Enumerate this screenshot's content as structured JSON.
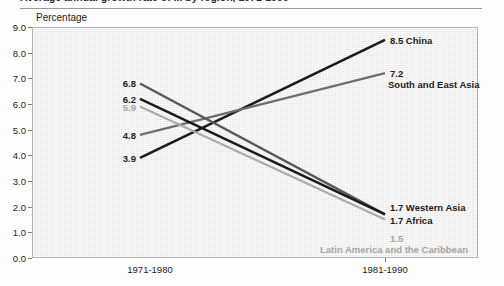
{
  "figure": {
    "title_partial": "Average annual growth rate of ... by region, 1971-1990",
    "y_axis_title": "Percentage"
  },
  "chart_data": {
    "type": "line",
    "title": "",
    "xlabel": "",
    "ylabel": "Percentage",
    "categories": [
      "1971-1980",
      "1981-1990"
    ],
    "ylim": [
      0.0,
      9.0
    ],
    "ytick_labels": [
      "0.0",
      "1.0",
      "2.0",
      "3.0",
      "4.0",
      "5.0",
      "6.0",
      "7.0",
      "8.0",
      "9.0"
    ],
    "yticks": [
      0.0,
      1.0,
      2.0,
      3.0,
      4.0,
      5.0,
      6.0,
      7.0,
      8.0,
      9.0
    ],
    "grid": false,
    "legend_position": "inline-endpoint-labels",
    "series": [
      {
        "name": "China",
        "values": [
          3.9,
          8.5
        ],
        "start_label": "3.9",
        "end_label": "8.5",
        "color": "#1a1a1a",
        "width": 2.6
      },
      {
        "name": "South and East Asia",
        "values": [
          4.8,
          7.2
        ],
        "start_label": "4.8",
        "end_label": "7.2",
        "color": "#6e6e6e",
        "width": 2.3
      },
      {
        "name": "Western Asia",
        "values": [
          6.8,
          1.7
        ],
        "start_label": "6.8",
        "end_label": "1.7",
        "color": "#585858",
        "width": 2.3
      },
      {
        "name": "Africa",
        "values": [
          6.2,
          1.7
        ],
        "start_label": "6.2",
        "end_label": "1.7",
        "color": "#1a1a1a",
        "width": 2.4
      },
      {
        "name": "Latin America and the Caribbean",
        "values": [
          5.9,
          1.5
        ],
        "start_label": "5.9",
        "end_label": "1.5",
        "color": "#ababab",
        "width": 2.2
      }
    ]
  },
  "left_labels": [
    {
      "value": "6.8",
      "color": "#1d1d1d"
    },
    {
      "value": "6.2",
      "color": "#1d1d1d"
    },
    {
      "value": "5.9",
      "color": "#a5a5a5"
    },
    {
      "value": "4.8",
      "color": "#1d1d1d"
    },
    {
      "value": "3.9",
      "color": "#1d1d1d"
    }
  ],
  "right_labels": [
    {
      "value": "8.5",
      "name": "China",
      "color": "#1d1d1d"
    },
    {
      "value": "7.2",
      "name": "South and East Asia",
      "color": "#1d1d1d"
    },
    {
      "value": "1.7",
      "name": "Western Asia",
      "color": "#1d1d1d"
    },
    {
      "value": "1.7",
      "name": "Africa",
      "color": "#1d1d1d"
    },
    {
      "value": "1.5",
      "name": "Latin America and the Caribbean",
      "color": "#a5a5a5"
    }
  ],
  "x_labels": [
    "1971-1980",
    "1981-1990"
  ],
  "colors": {
    "plot_bg": "#efefef",
    "frame": "#b3b3b3",
    "tick": "#7d7d7d",
    "text": "#1d1d1d",
    "muted_text": "#a5a5a5"
  }
}
